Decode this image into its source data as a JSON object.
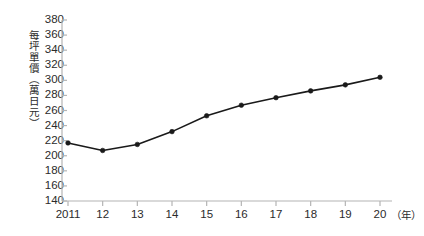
{
  "chart_data": {
    "type": "line",
    "title": "",
    "xlabel": "（年）",
    "ylabel": "每坪單價（萬日元）",
    "x": [
      2011,
      2012,
      2013,
      2014,
      2015,
      2016,
      2017,
      2018,
      2019,
      2020
    ],
    "categories": [
      "2011",
      "12",
      "13",
      "14",
      "15",
      "16",
      "17",
      "18",
      "19",
      "20"
    ],
    "values": [
      217,
      207,
      215,
      232,
      253,
      267,
      277,
      286,
      294,
      304
    ],
    "series": [
      {
        "name": "每坪單價",
        "values": [
          217,
          207,
          215,
          232,
          253,
          267,
          277,
          286,
          294,
          304
        ]
      }
    ],
    "ylim": [
      140,
      380
    ],
    "ytick_labels": [
      "380",
      "360",
      "340",
      "320",
      "300",
      "280",
      "260",
      "240",
      "220",
      "200",
      "180",
      "160",
      "140"
    ],
    "ytick_values": [
      380,
      360,
      340,
      320,
      300,
      280,
      260,
      240,
      220,
      200,
      180,
      160,
      140
    ],
    "xlim": [
      2011,
      2020
    ],
    "grid": false,
    "legend": null,
    "marker": "filled-circle",
    "line_color": "#1a1a1a",
    "axis_color": "#b4b4b4",
    "text_color": "#2b2b2b"
  },
  "axis": {
    "y_title": "每坪單價（萬日元）",
    "x_unit": "（年）"
  }
}
